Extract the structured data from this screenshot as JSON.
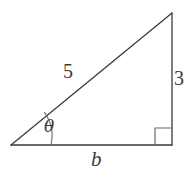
{
  "figure": {
    "type": "right-triangle",
    "background_color": "#ffffff",
    "stroke_color": "#3a3a3a",
    "label_color": "#3a3a3a",
    "stroke_width": 1.3
  },
  "labels": {
    "hypotenuse": "5",
    "opposite": "3",
    "adjacent": "b",
    "angle": "θ"
  },
  "geometry": {
    "vertices": {
      "left": {
        "x": 11,
        "y": 145
      },
      "bottom_right": {
        "x": 172,
        "y": 145
      },
      "apex": {
        "x": 172,
        "y": 13
      }
    },
    "angle_arc": {
      "center_x": 11,
      "center_y": 145,
      "radius": 40,
      "start_x": 51,
      "start_y": 145,
      "end_x": 45,
      "end_y": 112
    },
    "right_angle_marker": {
      "x": 155,
      "y": 128,
      "size": 17
    }
  }
}
